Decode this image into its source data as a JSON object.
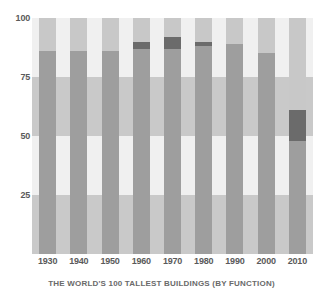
{
  "chart_data": {
    "type": "bar",
    "stacked": true,
    "title": "",
    "caption": "THE WORLD'S 100 TALLEST BUILDINGS (BY FUNCTION)",
    "xlabel": "",
    "ylabel": "",
    "ylim": [
      0,
      100
    ],
    "yticks": [
      25,
      50,
      75,
      100
    ],
    "ytick_labels": [
      "25",
      "50",
      "75",
      "100"
    ],
    "grid": false,
    "legend": "none",
    "categories": [
      "1930",
      "1940",
      "1950",
      "1960",
      "1970",
      "1980",
      "1990",
      "2000",
      "2010"
    ],
    "series": [
      {
        "name": "office",
        "color": "#9e9e9e",
        "values": [
          86,
          86,
          86,
          87,
          87,
          88,
          89,
          85,
          48
        ]
      },
      {
        "name": "mixed-use",
        "color": "#6b6b6b",
        "values": [
          0,
          0,
          0,
          3,
          5,
          2,
          0,
          0,
          13
        ]
      },
      {
        "name": "residential-other",
        "color": "#c8c8c8",
        "values": [
          14,
          14,
          14,
          10,
          8,
          10,
          11,
          15,
          39
        ]
      }
    ],
    "background_bands": [
      {
        "from": 0,
        "to": 25,
        "color": "#c9c9c9"
      },
      {
        "from": 25,
        "to": 50,
        "color": "#f0f0f0"
      },
      {
        "from": 50,
        "to": 75,
        "color": "#c9c9c9"
      },
      {
        "from": 75,
        "to": 100,
        "color": "#f0f0f0"
      }
    ]
  },
  "axis": {
    "y_tick_labels": [
      "100",
      "75",
      "50",
      "25"
    ],
    "y_tick_values": [
      100,
      75,
      50,
      25
    ],
    "x_tick_labels": [
      "1930",
      "1940",
      "1950",
      "1960",
      "1970",
      "1980",
      "1990",
      "2000",
      "2010"
    ]
  },
  "caption": {
    "text": "THE WORLD'S 100 TALLEST BUILDINGS (BY FUNCTION)"
  },
  "colors": {
    "office": "#9e9e9e",
    "mixed_use": "#6b6b6b",
    "residential_other": "#c8c8c8",
    "band_dark": "#c9c9c9",
    "band_light": "#f0f0f0",
    "text": "#5a5a5a"
  }
}
